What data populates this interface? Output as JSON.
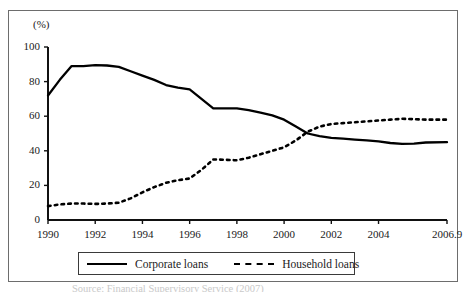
{
  "figure": {
    "y_unit_label": "(%)",
    "scan_caption": "Source: Financial Supervisory Service (2007)"
  },
  "legend": {
    "entries": [
      {
        "label": "Corporate loans",
        "style": "solid",
        "icon": "solid-line-swatch"
      },
      {
        "label": "Household loans",
        "style": "dashed",
        "icon": "dashed-line-swatch"
      }
    ]
  },
  "chart_data": {
    "type": "line",
    "title": "",
    "xlabel": "",
    "ylabel": "(%)",
    "ylim": [
      0,
      100
    ],
    "xlim": [
      1990,
      2006.9
    ],
    "grid": false,
    "legend_position": "bottom",
    "y_ticks": [
      0,
      20,
      40,
      60,
      80,
      100
    ],
    "y_tick_labels": [
      "0",
      "20",
      "40",
      "60",
      "80",
      "100"
    ],
    "x_ticks": [
      1990,
      1992,
      1994,
      1996,
      1998,
      2000,
      2002,
      2004,
      2006.9
    ],
    "x_tick_labels": [
      "1990",
      "1992",
      "1994",
      "1996",
      "1998",
      "2000",
      "2002",
      "2004",
      "2006.9"
    ],
    "x": [
      1990,
      1990.5,
      1991,
      1991.5,
      1992,
      1992.5,
      1993,
      1993.5,
      1994,
      1994.5,
      1995,
      1995.5,
      1996,
      1996.5,
      1997,
      1997.5,
      1998,
      1998.5,
      1999,
      1999.5,
      2000,
      2000.5,
      2001,
      2001.5,
      2002,
      2002.5,
      2003,
      2003.5,
      2004,
      2004.5,
      2005,
      2005.5,
      2006,
      2006.9
    ],
    "series": [
      {
        "name": "Corporate loans",
        "style": "solid",
        "values": [
          72,
          81,
          89,
          89,
          89.5,
          89.3,
          88.5,
          86,
          83.5,
          81,
          78,
          76.5,
          75.5,
          70,
          64.5,
          64.5,
          64.5,
          63.5,
          62,
          60.5,
          58,
          54,
          50,
          48.5,
          47.5,
          47,
          46.5,
          46,
          45.5,
          44.5,
          44,
          44.2,
          44.8,
          45
        ]
      },
      {
        "name": "Household loans",
        "style": "dashed",
        "values": [
          8,
          9,
          9.5,
          9.5,
          9.3,
          9.5,
          10,
          12.5,
          16,
          19,
          21.5,
          23,
          24,
          29,
          35,
          34.8,
          34.5,
          36,
          38,
          40,
          42,
          46,
          51,
          54,
          55.5,
          56,
          56.5,
          57,
          57.5,
          58,
          58.5,
          58.3,
          58,
          58
        ]
      }
    ]
  }
}
